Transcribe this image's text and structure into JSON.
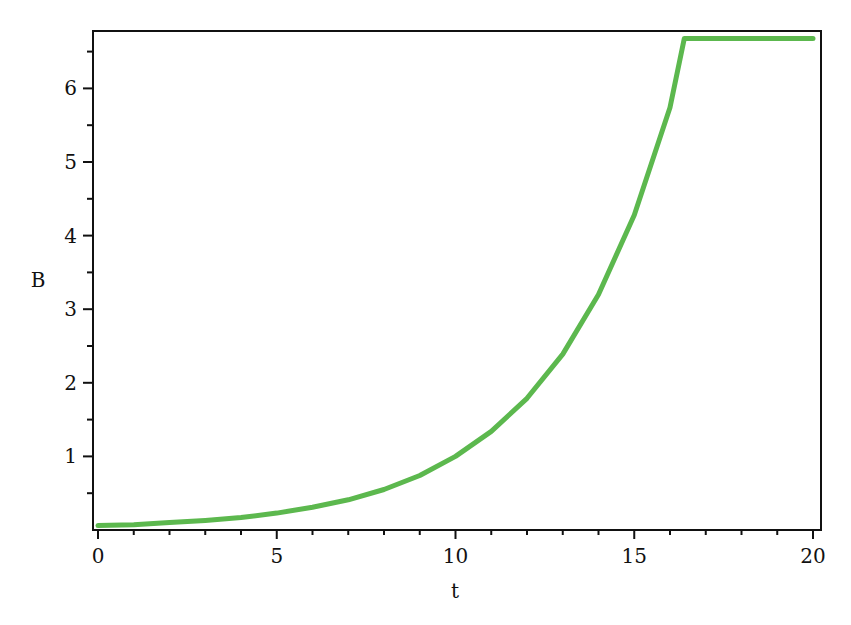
{
  "chart_data": {
    "type": "line",
    "title": "",
    "xlabel": "t",
    "ylabel": "B",
    "xlim": [
      0,
      20
    ],
    "ylim": [
      0,
      6.75
    ],
    "grid": false,
    "legend": null,
    "x_ticks": [
      0,
      5,
      10,
      15,
      20
    ],
    "x_tick_labels": [
      "0",
      "5",
      "10",
      "15",
      "20"
    ],
    "y_ticks": [
      1,
      2,
      3,
      4,
      5,
      6
    ],
    "y_tick_labels": [
      "1",
      "2",
      "3",
      "4",
      "5",
      "6"
    ],
    "series": [
      {
        "name": "B(t)",
        "color": "#5cb84e",
        "x": [
          0,
          1,
          2,
          3,
          4,
          5,
          6,
          7,
          8,
          9,
          10,
          11,
          12,
          13,
          14,
          15,
          16,
          16.4,
          17,
          18,
          19,
          20
        ],
        "values": [
          0.06,
          0.07,
          0.1,
          0.13,
          0.17,
          0.23,
          0.31,
          0.41,
          0.55,
          0.74,
          1.0,
          1.34,
          1.79,
          2.39,
          3.2,
          4.28,
          5.74,
          6.68,
          6.68,
          6.68,
          6.68,
          6.68
        ]
      }
    ]
  },
  "colors": {
    "axis": "#111111",
    "curve": "#5cb84e",
    "background": "#ffffff"
  }
}
